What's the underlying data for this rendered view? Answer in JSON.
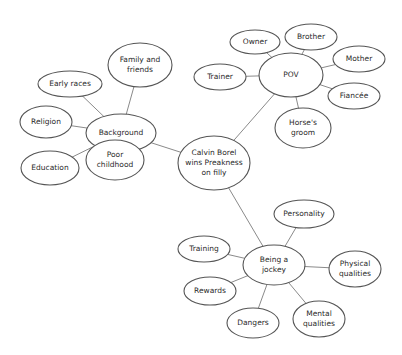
{
  "diagram": {
    "type": "mind-map",
    "central_topic": "Calvin Borel wins Preakness on filly",
    "colors": {
      "background": "#ffffff",
      "stroke": "#555555",
      "edge": "#8a8a8a",
      "text": "#2a2a2a"
    },
    "nodes": [
      {
        "id": "center",
        "lines": [
          "Calvin Borel",
          "wins Preakness",
          "on filly"
        ],
        "cx": 214,
        "cy": 163,
        "rx": 36,
        "ry": 27
      },
      {
        "id": "background",
        "lines": [
          "Background"
        ],
        "cx": 121,
        "cy": 133,
        "rx": 35,
        "ry": 19
      },
      {
        "id": "family",
        "lines": [
          "Family and",
          "friends"
        ],
        "cx": 140,
        "cy": 65,
        "rx": 32,
        "ry": 22
      },
      {
        "id": "early-races",
        "lines": [
          "Early races"
        ],
        "cx": 70,
        "cy": 84,
        "rx": 32,
        "ry": 13
      },
      {
        "id": "religion",
        "lines": [
          "Religion"
        ],
        "cx": 46,
        "cy": 122,
        "rx": 26,
        "ry": 16
      },
      {
        "id": "education",
        "lines": [
          "Education"
        ],
        "cx": 50,
        "cy": 168,
        "rx": 29,
        "ry": 17
      },
      {
        "id": "poor-childhood",
        "lines": [
          "Poor",
          "childhood"
        ],
        "cx": 115,
        "cy": 160,
        "rx": 29,
        "ry": 20
      },
      {
        "id": "pov",
        "lines": [
          "POV"
        ],
        "cx": 291,
        "cy": 75,
        "rx": 32,
        "ry": 22
      },
      {
        "id": "owner",
        "lines": [
          "Owner"
        ],
        "cx": 255,
        "cy": 42,
        "rx": 25,
        "ry": 12
      },
      {
        "id": "brother",
        "lines": [
          "Brother"
        ],
        "cx": 311,
        "cy": 37,
        "rx": 26,
        "ry": 13
      },
      {
        "id": "mother",
        "lines": [
          "Mother"
        ],
        "cx": 359,
        "cy": 59,
        "rx": 26,
        "ry": 13
      },
      {
        "id": "trainer",
        "lines": [
          "Trainer"
        ],
        "cx": 220,
        "cy": 77,
        "rx": 26,
        "ry": 13
      },
      {
        "id": "fiancee",
        "lines": [
          "Fiancée"
        ],
        "cx": 354,
        "cy": 96,
        "rx": 26,
        "ry": 13
      },
      {
        "id": "horses-groom",
        "lines": [
          "Horse's",
          "groom"
        ],
        "cx": 303,
        "cy": 128,
        "rx": 28,
        "ry": 20
      },
      {
        "id": "jockey",
        "lines": [
          "Being a",
          "jockey"
        ],
        "cx": 274,
        "cy": 265,
        "rx": 31,
        "ry": 20
      },
      {
        "id": "personality",
        "lines": [
          "Personality"
        ],
        "cx": 304,
        "cy": 214,
        "rx": 30,
        "ry": 14
      },
      {
        "id": "training",
        "lines": [
          "Training"
        ],
        "cx": 204,
        "cy": 249,
        "rx": 26,
        "ry": 13
      },
      {
        "id": "physical",
        "lines": [
          "Physical",
          "qualities"
        ],
        "cx": 355,
        "cy": 269,
        "rx": 26,
        "ry": 18
      },
      {
        "id": "rewards",
        "lines": [
          "Rewards"
        ],
        "cx": 210,
        "cy": 291,
        "rx": 26,
        "ry": 14
      },
      {
        "id": "dangers",
        "lines": [
          "Dangers"
        ],
        "cx": 253,
        "cy": 323,
        "rx": 26,
        "ry": 15
      },
      {
        "id": "mental",
        "lines": [
          "Mental",
          "qualities"
        ],
        "cx": 319,
        "cy": 319,
        "rx": 26,
        "ry": 18
      }
    ],
    "edges": [
      [
        "center",
        "background"
      ],
      [
        "center",
        "pov"
      ],
      [
        "center",
        "jockey"
      ],
      [
        "background",
        "family"
      ],
      [
        "background",
        "early-races"
      ],
      [
        "background",
        "religion"
      ],
      [
        "background",
        "education"
      ],
      [
        "background",
        "poor-childhood"
      ],
      [
        "pov",
        "owner"
      ],
      [
        "pov",
        "brother"
      ],
      [
        "pov",
        "mother"
      ],
      [
        "pov",
        "trainer"
      ],
      [
        "pov",
        "fiancee"
      ],
      [
        "pov",
        "horses-groom"
      ],
      [
        "jockey",
        "personality"
      ],
      [
        "jockey",
        "training"
      ],
      [
        "jockey",
        "physical"
      ],
      [
        "jockey",
        "rewards"
      ],
      [
        "jockey",
        "dangers"
      ],
      [
        "jockey",
        "mental"
      ]
    ]
  }
}
